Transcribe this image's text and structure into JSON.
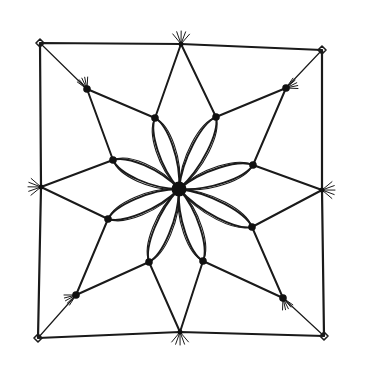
{
  "drawing": {
    "title": "Hand-drawn star mandala in a square",
    "ink_color": "#1a1a1a",
    "background": "#ffffff",
    "square": [
      [
        40,
        43
      ],
      [
        181,
        44
      ],
      [
        322,
        50
      ],
      [
        322,
        190
      ],
      [
        324,
        336
      ],
      [
        180,
        332
      ],
      [
        38,
        338
      ],
      [
        41,
        187
      ]
    ],
    "corners": [
      [
        40,
        43
      ],
      [
        322,
        50
      ],
      [
        324,
        336
      ],
      [
        38,
        338
      ]
    ],
    "apexes": [
      [
        181,
        44
      ],
      [
        322,
        190
      ],
      [
        180,
        332
      ],
      [
        41,
        187
      ]
    ],
    "diagonal_nodes": [
      [
        87,
        89
      ],
      [
        286,
        88
      ],
      [
        283,
        298
      ],
      [
        76,
        295
      ]
    ],
    "inner_nodes": [
      [
        155,
        118
      ],
      [
        216,
        117
      ],
      [
        253,
        165
      ],
      [
        252,
        227
      ],
      [
        203,
        261
      ],
      [
        149,
        262
      ],
      [
        108,
        219
      ],
      [
        113,
        160
      ]
    ],
    "center": [
      179,
      189
    ],
    "star_edges": [
      [
        [
          181,
          44
        ],
        [
          155,
          118
        ]
      ],
      [
        [
          181,
          44
        ],
        [
          216,
          117
        ]
      ],
      [
        [
          87,
          89
        ],
        [
          155,
          118
        ]
      ],
      [
        [
          87,
          89
        ],
        [
          113,
          160
        ]
      ],
      [
        [
          41,
          187
        ],
        [
          113,
          160
        ]
      ],
      [
        [
          41,
          187
        ],
        [
          108,
          219
        ]
      ],
      [
        [
          76,
          295
        ],
        [
          108,
          219
        ]
      ],
      [
        [
          76,
          295
        ],
        [
          149,
          262
        ]
      ],
      [
        [
          180,
          332
        ],
        [
          149,
          262
        ]
      ],
      [
        [
          180,
          332
        ],
        [
          203,
          261
        ]
      ],
      [
        [
          283,
          298
        ],
        [
          203,
          261
        ]
      ],
      [
        [
          283,
          298
        ],
        [
          252,
          227
        ]
      ],
      [
        [
          322,
          190
        ],
        [
          252,
          227
        ]
      ],
      [
        [
          322,
          190
        ],
        [
          253,
          165
        ]
      ],
      [
        [
          286,
          88
        ],
        [
          253,
          165
        ]
      ],
      [
        [
          286,
          88
        ],
        [
          216,
          117
        ]
      ],
      [
        [
          40,
          43
        ],
        [
          87,
          89
        ]
      ],
      [
        [
          322,
          50
        ],
        [
          286,
          88
        ]
      ],
      [
        [
          324,
          336
        ],
        [
          283,
          298
        ]
      ],
      [
        [
          38,
          338
        ],
        [
          76,
          295
        ]
      ]
    ]
  }
}
